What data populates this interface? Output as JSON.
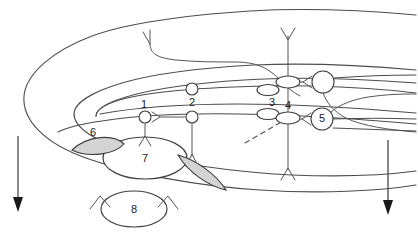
{
  "figure": {
    "type": "line-drawing-diagram",
    "background_color": "#ffffff",
    "line_color": "#4d4d4d",
    "shaded_fill_color": "#d4d4d4",
    "label_color": "#1a1a1a"
  },
  "labels": [
    {
      "id": "label-1",
      "text": "1",
      "x": 144,
      "y": 105
    },
    {
      "id": "label-2",
      "text": "2",
      "x": 192,
      "y": 103
    },
    {
      "id": "label-3",
      "text": "3",
      "x": 272,
      "y": 104
    },
    {
      "id": "label-4",
      "text": "4",
      "x": 288,
      "y": 109
    },
    {
      "id": "label-5",
      "text": "5",
      "x": 322,
      "y": 119
    },
    {
      "id": "label-6",
      "text": "6",
      "x": 93,
      "y": 136
    },
    {
      "id": "label-7",
      "text": "7",
      "x": 145,
      "y": 158
    },
    {
      "id": "label-8",
      "text": "8",
      "x": 134,
      "y": 209
    }
  ],
  "elements": {
    "cell_bodies": [
      {
        "name": "neuron-1-soma",
        "label": "1",
        "shape": "circle"
      },
      {
        "name": "neuron-2-soma",
        "label": "2",
        "shape": "circle"
      },
      {
        "name": "neuron-2-upper-soma",
        "label": "",
        "shape": "circle"
      },
      {
        "name": "neuron-5-soma",
        "label": "5",
        "shape": "circle-with-number"
      },
      {
        "name": "upper-right-soma",
        "label": "",
        "shape": "circle"
      },
      {
        "name": "neuron-7-soma",
        "label": "7",
        "shape": "ellipse"
      },
      {
        "name": "neuron-8-soma",
        "label": "8",
        "shape": "ellipse"
      }
    ],
    "terminals": [
      {
        "name": "terminal-3-upper",
        "label": ""
      },
      {
        "name": "terminal-3",
        "label": "3"
      },
      {
        "name": "terminal-4",
        "label": "4"
      },
      {
        "name": "terminal-upper-bouton",
        "label": ""
      }
    ],
    "shaded_lenses": [
      {
        "name": "shaded-lens-6",
        "label": "6"
      },
      {
        "name": "shaded-lens-right",
        "label": ""
      }
    ],
    "arrows": [
      {
        "name": "left-direction-arrow",
        "direction": "down"
      },
      {
        "name": "right-direction-arrow",
        "direction": "down"
      }
    ],
    "dashed_line": {
      "name": "dashed-projection-line"
    }
  }
}
